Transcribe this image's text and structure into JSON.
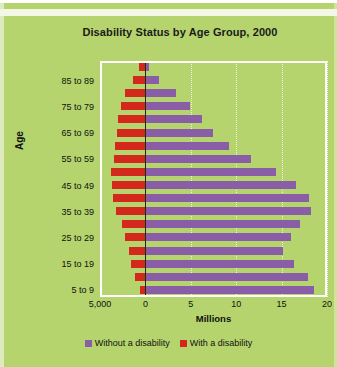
{
  "chart_data": {
    "type": "bar",
    "orientation": "horizontal",
    "subtype": "population-pyramid",
    "title": "Disability Status by Age Group, 2000",
    "xlabel": "Millions",
    "ylabel": "Age",
    "xlim": [
      -5,
      20
    ],
    "xticks": [
      -5,
      0,
      5,
      10,
      15,
      20
    ],
    "xtick_labels": [
      "5,000",
      "0",
      "5",
      "10",
      "15",
      "20"
    ],
    "grid": true,
    "grid_axis": "x",
    "legend_position": "bottom",
    "categories": [
      "5 to 9",
      "10 to 14",
      "15 to 19",
      "20 to 24",
      "25 to 29",
      "30 to 34",
      "35 to 39",
      "40 to 44",
      "45 to 49",
      "50 to 54",
      "55 to 59",
      "60 to 64",
      "65 to 69",
      "70 to 74",
      "75 to 79",
      "80 to 84",
      "85 to 89",
      "90+"
    ],
    "ytick_labels": [
      "5 to 9",
      "15 to 19",
      "25 to 29",
      "35 to 39",
      "45 to 49",
      "55 to 59",
      "65 to 69",
      "75 to 79",
      "85 to 89",
      "90+"
    ],
    "series": [
      {
        "name": "Without a disability",
        "color": "#8a5ea6",
        "direction": "right",
        "values": [
          18.6,
          17.9,
          16.4,
          15.2,
          16.0,
          17.0,
          18.2,
          18.0,
          16.6,
          14.4,
          11.6,
          9.2,
          7.4,
          6.2,
          4.9,
          3.4,
          1.5,
          0.4
        ]
      },
      {
        "name": "With a disability",
        "color": "#d4281c",
        "direction": "left",
        "values": [
          0.6,
          1.2,
          1.6,
          1.8,
          2.2,
          2.6,
          3.2,
          3.6,
          3.7,
          3.8,
          3.5,
          3.3,
          3.1,
          3.0,
          2.7,
          2.2,
          1.4,
          0.7
        ]
      }
    ]
  },
  "legend": {
    "items": [
      {
        "label": "Without a disability",
        "color": "#8a5ea6"
      },
      {
        "label": "With a disability",
        "color": "#d4281c"
      }
    ]
  }
}
